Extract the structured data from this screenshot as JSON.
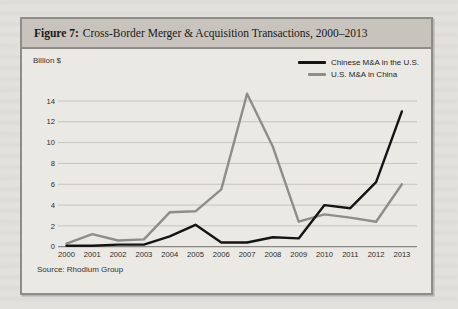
{
  "figure": {
    "label": "Figure 7:",
    "title": "Cross-Border Merger & Acquisition Transactions, 2000–2013",
    "ylabel": "Billion $",
    "source": "Source: Rhodium Group"
  },
  "chart_data": {
    "type": "line",
    "xlabel": "",
    "ylabel": "Billion $",
    "categories": [
      "2000",
      "2001",
      "2002",
      "2003",
      "2004",
      "2005",
      "2006",
      "2007",
      "2008",
      "2009",
      "2010",
      "2011",
      "2012",
      "2013"
    ],
    "series": [
      {
        "name": "Chinese M&A in the U.S.",
        "color": "#141414",
        "values": [
          0.1,
          0.1,
          0.2,
          0.2,
          1.0,
          2.1,
          0.4,
          0.4,
          0.9,
          0.8,
          4.0,
          3.7,
          6.2,
          13.0
        ]
      },
      {
        "name": "U.S. M&A in China",
        "color": "#8d8d8b",
        "values": [
          0.3,
          1.2,
          0.6,
          0.7,
          3.3,
          3.4,
          5.5,
          14.7,
          9.6,
          2.4,
          3.1,
          2.8,
          2.4,
          6.0
        ]
      }
    ],
    "ylim": [
      0,
      14
    ],
    "ytick_step": 2,
    "yticks": [
      0,
      2,
      4,
      6,
      8,
      10,
      12,
      14
    ],
    "grid": true,
    "legend_position": "top-right",
    "source": "Source: Rhodium Group"
  },
  "colors": {
    "page_background": "#e3e1dd",
    "figure_background": "#ebe9e4",
    "title_bar_background": "#c8c4bd",
    "border": "#8f8d88",
    "gridline": "#c6c4bf",
    "axis_line": "#8a8884",
    "series_chinese_ma_us": "#141414",
    "series_us_ma_china": "#8d8d8b"
  }
}
